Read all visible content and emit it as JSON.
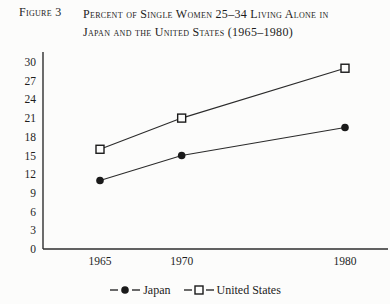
{
  "figure": {
    "label": "Figure 3",
    "title_lines": [
      "Percent of Single Women 25–34 Living Alone in",
      "Japan and the United States (1965–1980)"
    ]
  },
  "chart_data": {
    "type": "line",
    "title": "Percent of Single Women 25–34 Living Alone in Japan and the United States (1965–1980)",
    "x": [
      1965,
      1970,
      1980
    ],
    "x_labels": [
      "1965",
      "1970",
      "1980"
    ],
    "series": [
      {
        "name": "Japan",
        "marker": "filled-circle",
        "values": [
          11,
          15,
          19.5
        ]
      },
      {
        "name": "United States",
        "marker": "open-square",
        "values": [
          16,
          21,
          29
        ]
      }
    ],
    "ylim": [
      0,
      30
    ],
    "yticks": [
      0,
      3,
      6,
      9,
      12,
      15,
      18,
      21,
      24,
      27,
      30
    ],
    "grid": false,
    "legend_position": "bottom",
    "line_color": "#2b2b2b",
    "marker_fill_japan": "#1a1a1a",
    "marker_fill_us": "#fcfcfb",
    "axis_color": "#2e2e2e",
    "background": "#fcfcfb"
  }
}
